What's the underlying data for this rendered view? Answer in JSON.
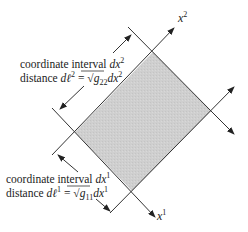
{
  "diagram": {
    "fill_color": "#d0d0d0",
    "line_color": "#333333",
    "axes": {
      "x1_label": "x",
      "x1_sup": "1",
      "x2_label": "x",
      "x2_sup": "2"
    },
    "annotation_upper": {
      "line1_prefix": "coordinate interval ",
      "line1_var": "dx",
      "line1_sup": "2",
      "line2_prefix": "distance ",
      "line2_lhs": "dℓ",
      "line2_lhs_sup": "2",
      "line2_eq": " = ",
      "line2_sqrt": "√",
      "line2_g": "g",
      "line2_g_sub": "22",
      "line2_var": "dx",
      "line2_var_sup": "2"
    },
    "annotation_lower": {
      "line1_prefix": "coordinate interval ",
      "line1_var": "dx",
      "line1_sup": "1",
      "line2_prefix": "distance ",
      "line2_lhs": "dℓ",
      "line2_lhs_sup": "1",
      "line2_eq": " = ",
      "line2_sqrt": "√",
      "line2_g": "g",
      "line2_g_sub": "11",
      "line2_var": "dx",
      "line2_var_sup": "1"
    }
  }
}
